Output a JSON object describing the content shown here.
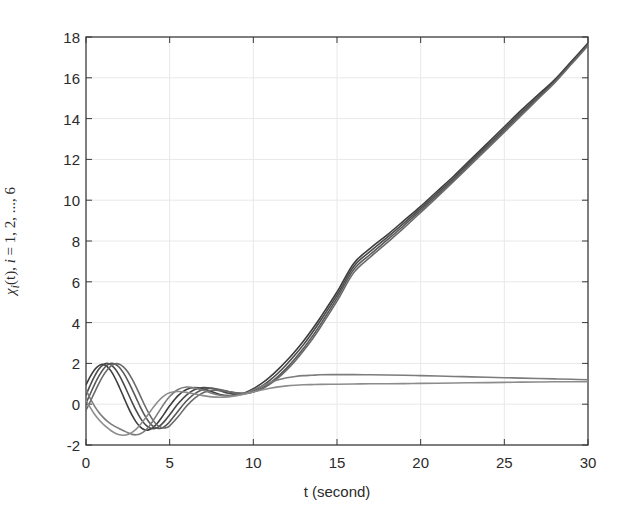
{
  "chart_data": {
    "type": "line",
    "title": "",
    "xlabel": "t (second)",
    "ylabel": "χᵢ(t), i = 1, 2, ..., 6",
    "ylabel_parts": {
      "symbol": "χ",
      "subscript": "i",
      "arg": "(t),",
      "index_var": "i",
      "equals": "=",
      "range": "1, 2, ..., 6"
    },
    "xlim": [
      0,
      30
    ],
    "ylim": [
      -2,
      18
    ],
    "xticks": [
      0,
      5,
      10,
      15,
      20,
      25,
      30
    ],
    "yticks": [
      -2,
      0,
      2,
      4,
      6,
      8,
      10,
      12,
      14,
      16,
      18
    ],
    "xtick_labels": [
      "0",
      "5",
      "10",
      "15",
      "20",
      "25",
      "30"
    ],
    "ytick_labels": [
      "-2",
      "0",
      "2",
      "4",
      "6",
      "8",
      "10",
      "12",
      "14",
      "16",
      "18"
    ],
    "grid": true,
    "grid_color": "#e8e8ea",
    "legend": "none",
    "axis_color": "#3a3a3a",
    "background": "#ffffff",
    "n_series": 6,
    "x": [
      0,
      0.25,
      0.5,
      0.75,
      1,
      1.25,
      1.5,
      1.75,
      2,
      2.25,
      2.5,
      2.75,
      3,
      3.25,
      3.5,
      3.75,
      4,
      4.25,
      4.5,
      4.75,
      5,
      5.5,
      6,
      6.5,
      7,
      7.5,
      8,
      8.5,
      9,
      9.5,
      10,
      10.5,
      11,
      11.5,
      12,
      12.5,
      13,
      13.5,
      14,
      15,
      16,
      17,
      18,
      19,
      20,
      21,
      22,
      23,
      24,
      25,
      26,
      27,
      28,
      29,
      30
    ],
    "series": [
      {
        "name": "χ₁(t)",
        "color": "#3c3c3c",
        "width": 1.6,
        "values": [
          0.95,
          1.35,
          1.68,
          1.88,
          1.95,
          1.86,
          1.62,
          1.26,
          0.82,
          0.35,
          -0.12,
          -0.54,
          -0.88,
          -1.12,
          -1.25,
          -1.26,
          -1.15,
          -0.95,
          -0.68,
          -0.38,
          -0.08,
          0.42,
          0.72,
          0.82,
          0.76,
          0.62,
          0.48,
          0.42,
          0.44,
          0.56,
          0.76,
          1.02,
          1.34,
          1.72,
          2.14,
          2.6,
          3.1,
          3.65,
          4.24,
          5.5,
          6.9,
          7.65,
          8.3,
          9.0,
          9.7,
          10.45,
          11.2,
          12.0,
          12.8,
          13.6,
          14.4,
          15.15,
          15.9,
          16.8,
          17.7
        ]
      },
      {
        "name": "χ₂(t)",
        "color": "#4a4a4a",
        "width": 1.6,
        "values": [
          0.45,
          0.92,
          1.35,
          1.7,
          1.92,
          2.0,
          1.93,
          1.72,
          1.4,
          1.0,
          0.55,
          0.1,
          -0.32,
          -0.68,
          -0.96,
          -1.14,
          -1.2,
          -1.15,
          -1.0,
          -0.78,
          -0.52,
          0.02,
          0.45,
          0.72,
          0.82,
          0.78,
          0.66,
          0.54,
          0.48,
          0.52,
          0.66,
          0.88,
          1.18,
          1.54,
          1.96,
          2.42,
          2.92,
          3.48,
          4.08,
          5.35,
          6.75,
          7.5,
          8.18,
          8.88,
          9.6,
          10.35,
          11.1,
          11.9,
          12.7,
          13.5,
          14.3,
          15.05,
          15.85,
          16.75,
          17.65
        ]
      },
      {
        "name": "χ₃(t)",
        "color": "#585858",
        "width": 1.6,
        "values": [
          0.05,
          0.5,
          0.95,
          1.35,
          1.68,
          1.9,
          2.0,
          1.96,
          1.8,
          1.52,
          1.16,
          0.74,
          0.3,
          -0.14,
          -0.54,
          -0.86,
          -1.08,
          -1.18,
          -1.18,
          -1.06,
          -0.86,
          -0.34,
          0.16,
          0.52,
          0.72,
          0.78,
          0.72,
          0.62,
          0.54,
          0.52,
          0.6,
          0.78,
          1.04,
          1.38,
          1.78,
          2.24,
          2.74,
          3.3,
          3.9,
          5.2,
          6.6,
          7.35,
          8.05,
          8.76,
          9.5,
          10.25,
          11.02,
          11.82,
          12.62,
          13.42,
          14.22,
          15.0,
          15.8,
          16.7,
          17.62
        ]
      },
      {
        "name": "χ₄(t)",
        "color": "#6a6a6a",
        "width": 1.6,
        "values": [
          -0.3,
          0.12,
          0.56,
          0.98,
          1.36,
          1.66,
          1.88,
          1.98,
          1.96,
          1.82,
          1.58,
          1.24,
          0.84,
          0.4,
          -0.04,
          -0.44,
          -0.78,
          -1.02,
          -1.14,
          -1.16,
          -1.06,
          -0.62,
          -0.1,
          0.3,
          0.56,
          0.68,
          0.68,
          0.62,
          0.56,
          0.54,
          0.6,
          0.74,
          0.98,
          1.3,
          1.68,
          2.12,
          2.62,
          3.16,
          3.76,
          5.05,
          6.45,
          7.22,
          7.92,
          8.64,
          9.4,
          10.16,
          10.94,
          11.74,
          12.54,
          13.34,
          14.14,
          14.95,
          15.75,
          16.66,
          17.58
        ]
      },
      {
        "name": "χ₅(t)",
        "color": "#7c7c7c",
        "width": 1.6,
        "values": [
          0.7,
          0.28,
          -0.08,
          -0.38,
          -0.62,
          -0.82,
          -0.98,
          -1.1,
          -1.2,
          -1.3,
          -1.4,
          -1.48,
          -1.5,
          -1.45,
          -1.32,
          -1.1,
          -0.82,
          -0.5,
          -0.18,
          0.12,
          0.38,
          0.72,
          0.84,
          0.8,
          0.68,
          0.54,
          0.44,
          0.4,
          0.44,
          0.54,
          0.7,
          0.88,
          1.06,
          1.2,
          1.3,
          1.36,
          1.4,
          1.42,
          1.44,
          1.45,
          1.45,
          1.44,
          1.43,
          1.42,
          1.4,
          1.38,
          1.36,
          1.34,
          1.32,
          1.3,
          1.28,
          1.26,
          1.24,
          1.22,
          1.2
        ]
      },
      {
        "name": "χ₆(t)",
        "color": "#8c8c8c",
        "width": 1.6,
        "values": [
          0.2,
          -0.16,
          -0.48,
          -0.74,
          -0.96,
          -1.14,
          -1.3,
          -1.42,
          -1.5,
          -1.52,
          -1.48,
          -1.38,
          -1.22,
          -1.0,
          -0.74,
          -0.46,
          -0.18,
          0.08,
          0.3,
          0.46,
          0.56,
          0.62,
          0.58,
          0.5,
          0.42,
          0.36,
          0.34,
          0.36,
          0.42,
          0.5,
          0.6,
          0.7,
          0.78,
          0.85,
          0.9,
          0.93,
          0.95,
          0.96,
          0.97,
          0.98,
          0.99,
          1.0,
          1.0,
          1.01,
          1.02,
          1.03,
          1.04,
          1.05,
          1.06,
          1.07,
          1.08,
          1.09,
          1.1,
          1.1,
          1.1
        ]
      }
    ],
    "notes": {
      "divergent_bundle_count": 4,
      "bounded_bundle_count": 2,
      "peak_oscillation_value": 2.1,
      "trough_oscillation_value": -1.52,
      "endpoint_divergent": 17.7,
      "endpoint_bounded": 1.1
    }
  },
  "axes_geometry": {
    "left_px": 86,
    "right_px": 588,
    "top_px": 37,
    "bottom_px": 445
  }
}
